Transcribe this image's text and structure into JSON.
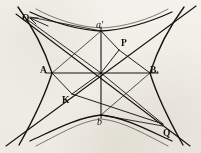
{
  "figure": {
    "kind": "geometric-diagram",
    "background_color": "#f4f2ec",
    "ink_color": "#15120e",
    "width": 201,
    "height": 153
  },
  "labels": [
    {
      "id": "O",
      "text": "O",
      "x": 22,
      "y": 14,
      "style": "roman"
    },
    {
      "id": "a1",
      "text": "a'",
      "x": 96,
      "y": 20,
      "style": "italic"
    },
    {
      "id": "P",
      "text": "P",
      "x": 121,
      "y": 39,
      "style": "roman"
    },
    {
      "id": "A",
      "text": "A",
      "x": 40,
      "y": 66,
      "style": "roman"
    },
    {
      "id": "B",
      "text": "B.",
      "x": 150,
      "y": 66,
      "style": "roman"
    },
    {
      "id": "K",
      "text": "K",
      "x": 62,
      "y": 96,
      "style": "roman"
    },
    {
      "id": "b",
      "text": "b",
      "x": 97,
      "y": 117,
      "style": "italic"
    },
    {
      "id": "Q",
      "text": "Q",
      "x": 163,
      "y": 129,
      "style": "roman"
    }
  ],
  "points": {
    "center": {
      "x": 101,
      "y": 73
    },
    "vertex_A": {
      "x": 52,
      "y": 73
    },
    "vertex_B": {
      "x": 150,
      "y": 73
    },
    "vertex_a": {
      "x": 101,
      "y": 31
    },
    "vertex_b": {
      "x": 101,
      "y": 115
    },
    "point_P": {
      "x": 119,
      "y": 50
    },
    "point_K": {
      "x": 72,
      "y": 94
    },
    "point_Q": {
      "x": 163,
      "y": 124
    },
    "point_O": {
      "x": 28,
      "y": 20
    }
  },
  "elements": {
    "axes": [
      "horizontal-transverse-axis-AB",
      "vertical-conjugate-axis-ab"
    ],
    "asymptotes": [
      "asymptote-nw-se",
      "asymptote-sw-ne"
    ],
    "chords": [
      "chord-a-prime-P",
      "chord-P-B",
      "chord-A-K",
      "chord-K-Q",
      "chord-O-center",
      "chord-center-Q"
    ],
    "curves": [
      "hyperbola-branch-left",
      "hyperbola-branch-right",
      "hyperbola-branch-upper",
      "hyperbola-branch-lower"
    ],
    "arrow": "arrow-to-O"
  }
}
